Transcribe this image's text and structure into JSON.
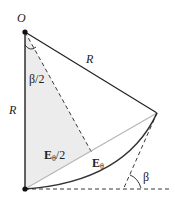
{
  "diagram": {
    "labels": {
      "origin": "O",
      "radius_top": "R",
      "radius_left": "R",
      "half_angle": "β/2",
      "half_field_main": "E",
      "half_field_sub": "θ",
      "half_field_suffix": "/2",
      "field_main": "E",
      "field_sub": "θ",
      "angle": "β"
    },
    "points": {
      "O": [
        25,
        32
      ],
      "bottom": [
        25,
        189
      ],
      "apex": [
        157,
        113
      ],
      "chord_mid": [
        91,
        151
      ]
    },
    "colors": {
      "line": "#222222",
      "chord": "#b8b8b8",
      "shade": "#ececec",
      "arc": "#333333"
    }
  }
}
